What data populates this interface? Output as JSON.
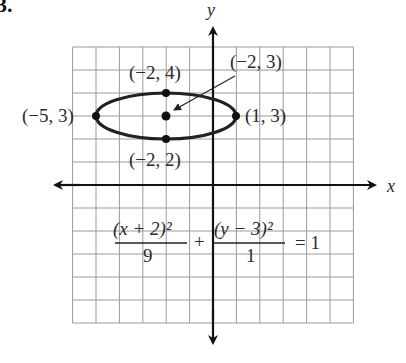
{
  "problem_number": "3.",
  "axes": {
    "x_label": "x",
    "y_label": "y"
  },
  "grid": {
    "x_min": -6,
    "x_max": 6,
    "y_min": -6,
    "y_max": 6,
    "step": 1
  },
  "ellipse": {
    "center": {
      "x": -2,
      "y": 3
    },
    "a": 3,
    "b": 1,
    "equation": {
      "term1_numerator": "(x + 2)²",
      "term1_denominator": "9",
      "plus": "+",
      "term2_numerator": "(y − 3)²",
      "term2_denominator": "1",
      "rhs": "= 1"
    }
  },
  "points": [
    {
      "label": "(−2, 4)",
      "x": -2,
      "y": 4
    },
    {
      "label": "(−2, 3)",
      "x": -2,
      "y": 3
    },
    {
      "label": "(−5, 3)",
      "x": -5,
      "y": 3
    },
    {
      "label": "(1, 3)",
      "x": 1,
      "y": 3
    },
    {
      "label": "(−2, 2)",
      "x": -2,
      "y": 2
    }
  ],
  "colors": {
    "grid": "#9a9a9a",
    "axis": "#111111",
    "curve": "#222222",
    "text": "#2a2a2a"
  }
}
